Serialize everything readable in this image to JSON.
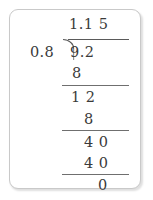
{
  "worksheet": {
    "type": "long-division",
    "expression": "9.2 ÷ 0.8 = 1.15",
    "divisor": "0.8",
    "dividend": "9.2",
    "quotient": "1.1 5",
    "bracket_icon": "division-bracket-icon",
    "steps": [
      {
        "label": "subtract-1",
        "value": "8"
      },
      {
        "label": "remainder-1",
        "value": "1 2"
      },
      {
        "label": "subtract-2",
        "value": "8"
      },
      {
        "label": "bring-down-1",
        "value": "4 0"
      },
      {
        "label": "subtract-3",
        "value": "4 0"
      },
      {
        "label": "final-remainder",
        "value": "0"
      }
    ]
  },
  "colors": {
    "ink": "#3a3a3a",
    "rule": "#6f6f6f",
    "card_border": "#c9c9c9",
    "background": "#ffffff"
  }
}
